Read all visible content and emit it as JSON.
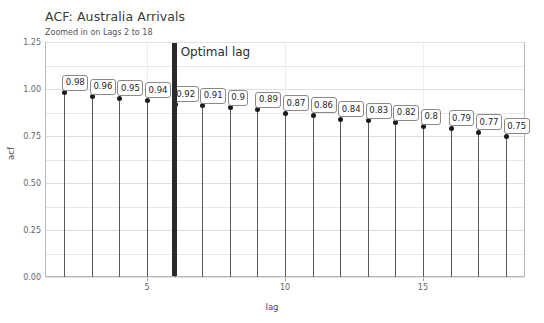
{
  "chart_data": {
    "type": "bar",
    "title": "ACF: Australia Arrivals",
    "subtitle": "Zoomed in on Lags 2 to 18",
    "xlabel": "lag",
    "ylabel": "acf",
    "categories": [
      2,
      3,
      4,
      5,
      6,
      7,
      8,
      9,
      10,
      11,
      12,
      13,
      14,
      15,
      16,
      17,
      18
    ],
    "values": [
      0.98,
      0.96,
      0.95,
      0.94,
      0.92,
      0.91,
      0.9,
      0.89,
      0.87,
      0.86,
      0.84,
      0.83,
      0.82,
      0.8,
      0.79,
      0.77,
      0.75
    ],
    "data_labels": [
      "0.98",
      "0.96",
      "0.95",
      "0.94",
      "0.92",
      "0.91",
      "0.9",
      "0.89",
      "0.87",
      "0.86",
      "0.84",
      "0.83",
      "0.82",
      "0.8",
      "0.79",
      "0.77",
      "0.75"
    ],
    "ylim": [
      0.0,
      1.25
    ],
    "xlim": [
      1.3,
      18.7
    ],
    "ytick_labels": [
      "0.00",
      "0.25",
      "0.50",
      "0.75",
      "1.00",
      "1.25"
    ],
    "ytick_values": [
      0.0,
      0.25,
      0.5,
      0.75,
      1.0,
      1.25
    ],
    "xtick_labels": [
      "5",
      "10",
      "15"
    ],
    "xtick_values": [
      5,
      10,
      15
    ],
    "grid": true,
    "legend": "none",
    "annotations": [
      {
        "text": "Optimal lag",
        "lag": 6,
        "style": "vertical-rule"
      }
    ],
    "marker": "filled-circle",
    "accent_color": "#2a2a2a",
    "stem_color": "#5a5a5a",
    "grid_color": "#e8e8e8"
  }
}
